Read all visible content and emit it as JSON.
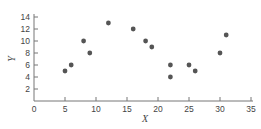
{
  "chart_data": {
    "type": "scatter",
    "title": "",
    "xlabel": "X",
    "ylabel": "Y",
    "xlim": [
      0,
      35
    ],
    "ylim": [
      0,
      14
    ],
    "xticks": [
      0,
      5,
      10,
      15,
      20,
      25,
      30,
      35
    ],
    "yticks": [
      2,
      4,
      6,
      8,
      10,
      12,
      14
    ],
    "grid": false,
    "legend": null,
    "series": [
      {
        "name": "data",
        "color": "#555555",
        "points": [
          {
            "x": 5,
            "y": 5
          },
          {
            "x": 6,
            "y": 6
          },
          {
            "x": 8,
            "y": 10
          },
          {
            "x": 9,
            "y": 8
          },
          {
            "x": 12,
            "y": 13
          },
          {
            "x": 16,
            "y": 12
          },
          {
            "x": 18,
            "y": 10
          },
          {
            "x": 19,
            "y": 9
          },
          {
            "x": 22,
            "y": 6
          },
          {
            "x": 22,
            "y": 4
          },
          {
            "x": 25,
            "y": 6
          },
          {
            "x": 26,
            "y": 5
          },
          {
            "x": 30,
            "y": 8
          },
          {
            "x": 31,
            "y": 11
          }
        ]
      }
    ]
  },
  "colors": {
    "axis": "#777777",
    "text": "#444444",
    "marker": "#555555"
  }
}
